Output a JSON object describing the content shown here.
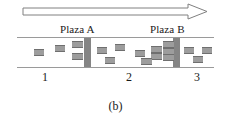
{
  "figure": {
    "caption": "(b)",
    "width": 231,
    "height": 129
  },
  "arrow": {
    "name": "flow-direction-arrow",
    "direction": "right",
    "style": "hollow-outline",
    "stroke_color": "#808080",
    "fill_color": "#ffffff"
  },
  "plazas": [
    {
      "label": "Plaza A",
      "bar_color": "#858585"
    },
    {
      "label": "Plaza B",
      "bar_color": "#858585"
    }
  ],
  "road": {
    "edge_color": "#9a9a9a",
    "fill_color": "#ffffff"
  },
  "segments": [
    {
      "label": "1"
    },
    {
      "label": "2"
    },
    {
      "label": "3"
    }
  ],
  "vehicles": {
    "color": "#9d9d9d",
    "outline_color": "#6f6f6f",
    "items": [
      {
        "x": 17,
        "y": 12,
        "w": 10,
        "h": 5
      },
      {
        "x": 38,
        "y": 8,
        "w": 10,
        "h": 5
      },
      {
        "x": 55,
        "y": 4,
        "w": 11,
        "h": 5
      },
      {
        "x": 55,
        "y": 16,
        "w": 11,
        "h": 5
      },
      {
        "x": 80,
        "y": 10,
        "w": 10,
        "h": 5
      },
      {
        "x": 98,
        "y": 7,
        "w": 10,
        "h": 5
      },
      {
        "x": 88,
        "y": 20,
        "w": 10,
        "h": 5
      },
      {
        "x": 118,
        "y": 13,
        "w": 10,
        "h": 5
      },
      {
        "x": 134,
        "y": 9,
        "w": 11,
        "h": 5
      },
      {
        "x": 146,
        "y": 4,
        "w": 11,
        "h": 5
      },
      {
        "x": 146,
        "y": 11,
        "w": 11,
        "h": 5
      },
      {
        "x": 134,
        "y": 16,
        "w": 11,
        "h": 5
      },
      {
        "x": 146,
        "y": 17,
        "w": 11,
        "h": 5
      },
      {
        "x": 124,
        "y": 21,
        "w": 11,
        "h": 5
      },
      {
        "x": 167,
        "y": 10,
        "w": 10,
        "h": 5
      },
      {
        "x": 185,
        "y": 10,
        "w": 10,
        "h": 5
      },
      {
        "x": 176,
        "y": 19,
        "w": 10,
        "h": 5
      }
    ]
  }
}
